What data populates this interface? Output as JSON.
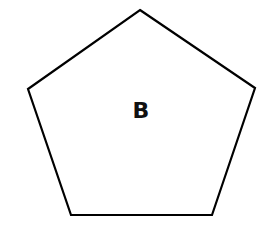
{
  "diagram": {
    "shape": "pentagon",
    "label": "B",
    "stroke_color": "#000000",
    "fill_color": "#ffffff",
    "vertices": [
      [
        140,
        10
      ],
      [
        255,
        88
      ],
      [
        212,
        215
      ],
      [
        71,
        215
      ],
      [
        28,
        89
      ]
    ]
  }
}
